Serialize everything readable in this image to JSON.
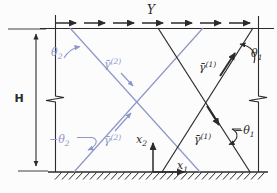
{
  "figure": {
    "background": "#fcfcfc",
    "colors": {
      "slip_system_1": "#2b2b2b",
      "slip_system_2": "#8d96c8"
    },
    "labels": {
      "shear": "Y",
      "height": "H",
      "theta1": {
        "base": "θ",
        "sub": "1"
      },
      "neg_theta1": {
        "base": "−θ",
        "sub": "1"
      },
      "theta2": {
        "base": "θ",
        "sub": "2"
      },
      "neg_theta2": {
        "base": "−θ",
        "sub": "2"
      },
      "gamma_s1": {
        "base": "γ̄",
        "sup": "(1)"
      },
      "gamma_s2": {
        "base": "γ̄",
        "sup": "(2)"
      },
      "axis_x1": {
        "base": "x",
        "sub": "1"
      },
      "axis_x2": {
        "base": "x",
        "sub": "2"
      }
    }
  }
}
